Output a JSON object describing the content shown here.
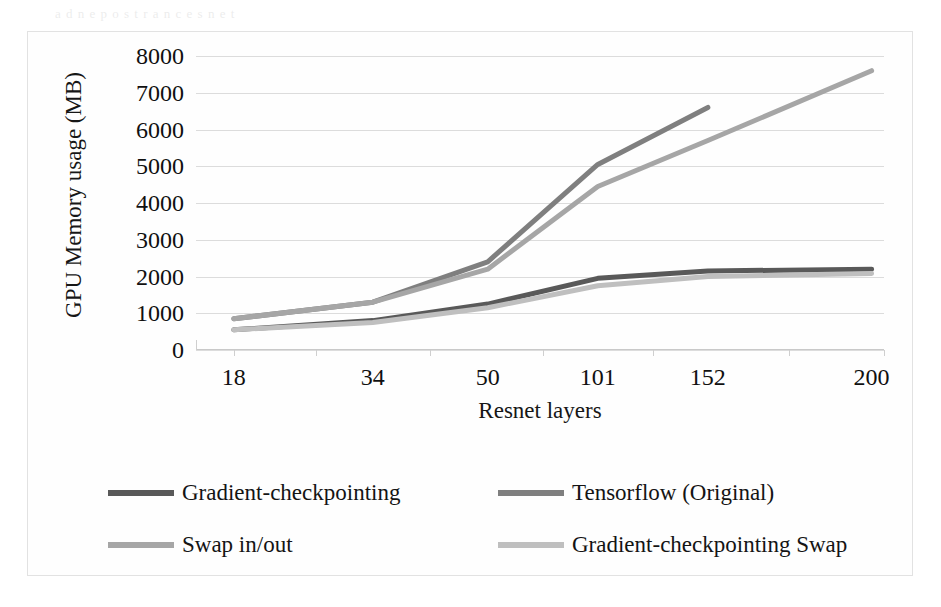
{
  "figure": {
    "ghost_text_top": "a  d  n  e  p  o  s  t  r  a  n  c  e        s  n  e  t",
    "ylabel": "GPU Memory usage (MB)",
    "xlabel": "Resnet layers"
  },
  "colors": {
    "series_gradient_checkpointing": "#595959",
    "series_tensorflow_original": "#7f7f7f",
    "series_swap_in_out": "#a6a6a6",
    "series_gradient_checkpointing_swap": "#bfbfbf",
    "gridline": "#dcdcdc",
    "axis": "#c9c9c9",
    "text": "#141414",
    "background": "#ffffff"
  },
  "chart_data": {
    "type": "line",
    "title": "",
    "subtitle": "",
    "xlabel": "Resnet layers",
    "ylabel": "GPU Memory usage (MB)",
    "categories": [
      "18",
      "34",
      "50",
      "101",
      "152",
      "200"
    ],
    "ylim": [
      0,
      8000
    ],
    "ytick_labels": [
      "0",
      "1000",
      "2000",
      "3000",
      "4000",
      "5000",
      "6000",
      "7000",
      "8000"
    ],
    "ytick_values": [
      0,
      1000,
      2000,
      3000,
      4000,
      5000,
      6000,
      7000,
      8000
    ],
    "grid": true,
    "legend_position": "bottom",
    "series": [
      {
        "name": "Gradient-checkpointing",
        "color": "#595959",
        "values": [
          550,
          800,
          1250,
          1950,
          2150,
          2200
        ]
      },
      {
        "name": "Tensorflow (Original)",
        "color": "#7f7f7f",
        "values": [
          850,
          1300,
          2400,
          5050,
          6600,
          null
        ]
      },
      {
        "name": "Swap in/out",
        "color": "#a6a6a6",
        "values": [
          850,
          1300,
          2200,
          4450,
          5700,
          7600
        ]
      },
      {
        "name": "Gradient-checkpointing Swap",
        "color": "#bfbfbf",
        "values": [
          550,
          750,
          1150,
          1750,
          2000,
          2080
        ]
      }
    ]
  },
  "legend": {
    "items": [
      {
        "label": "Gradient-checkpointing",
        "color": "#595959"
      },
      {
        "label": "Tensorflow (Original)",
        "color": "#7f7f7f"
      },
      {
        "label": "Swap in/out",
        "color": "#a6a6a6"
      },
      {
        "label": "Gradient-checkpointing Swap",
        "color": "#bfbfbf"
      }
    ]
  }
}
